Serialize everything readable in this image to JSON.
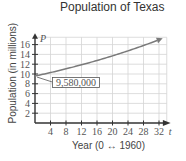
{
  "chart_data": {
    "type": "line",
    "title": "Population of Texas",
    "xlabel": "Year (0 ↔ 1960)",
    "ylabel": "Population (in millions)",
    "x_axis_var": "t",
    "y_axis_var": "P",
    "xticks": [
      4,
      8,
      12,
      16,
      20,
      24,
      28,
      32
    ],
    "yticks": [
      2,
      4,
      6,
      8,
      10,
      12,
      14,
      16
    ],
    "xlim": [
      0,
      34
    ],
    "ylim": [
      0,
      17
    ],
    "grid": true,
    "legend": null,
    "series": [
      {
        "name": "P(t)",
        "x": [
          0,
          4,
          8,
          12,
          16,
          20,
          24,
          28,
          32
        ],
        "values": [
          9.58,
          10.3,
          11.1,
          11.9,
          12.8,
          13.8,
          14.8,
          15.9,
          17.0
        ]
      }
    ],
    "annotations": [
      {
        "text": "9,580,000",
        "x": 0,
        "y": 9.58
      }
    ]
  },
  "labels": {
    "title": "Population of Texas",
    "ylabel": "Population (in millions)",
    "xlabel": "Year (0 ↔ 1960)",
    "p_var": "P",
    "t_var": "t",
    "annotation": "9,580,000"
  }
}
